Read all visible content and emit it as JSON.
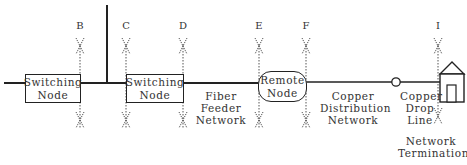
{
  "diagram": {
    "type": "network-reference-diagram",
    "nodes": {
      "switching_node_1": {
        "line1": "Switching",
        "line2": "Node"
      },
      "switching_node_2": {
        "line1": "Switching",
        "line2": "Node"
      },
      "remote_node": {
        "line1": "Remote",
        "line2": "Node"
      },
      "network_termination": {
        "line1": "Network",
        "line2": "Termination"
      }
    },
    "segments": {
      "fiber_feeder": {
        "line1": "Fiber",
        "line2": "Feeder",
        "line3": "Network"
      },
      "copper_distribution": {
        "line1": "Copper",
        "line2": "Distribution",
        "line3": "Network"
      },
      "copper_drop": {
        "line1": "Copper",
        "line2": "Drop",
        "line3": "Line"
      }
    },
    "reference_points": [
      {
        "id": "B",
        "x": 80
      },
      {
        "id": "C",
        "x": 126
      },
      {
        "id": "D",
        "x": 183
      },
      {
        "id": "E",
        "x": 259
      },
      {
        "id": "F",
        "x": 306
      },
      {
        "id": "I",
        "x": 437
      }
    ],
    "colors": {
      "line": "#222222",
      "dotted": "#555555",
      "text": "#333333"
    }
  }
}
